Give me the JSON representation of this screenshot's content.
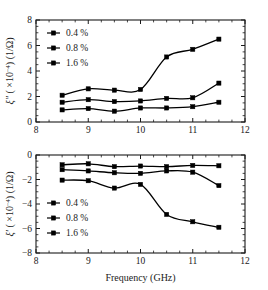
{
  "figure": {
    "background": "#ffffff",
    "line_color": "#000000",
    "text_color": "#1a1a1a"
  },
  "axis": {
    "xlabel": "Frequency (GHz)",
    "xticks": [
      "8",
      "9",
      "10",
      "11",
      "12"
    ],
    "top_ylabel_parts": {
      "symbol": "ξ″",
      "scale_open": " ( ×10",
      "exponent": "-4",
      "scale_close": ") (1/Ω)"
    },
    "bottom_ylabel_parts": {
      "symbol": "ξ′",
      "scale_open": " ( ×10",
      "exponent": "-4",
      "scale_close": ") (1/Ω)"
    },
    "top_yticks": [
      "0",
      "2",
      "4",
      "6",
      "8"
    ],
    "bottom_yticks": [
      "-8",
      "-6",
      "-4",
      "-2",
      "0"
    ]
  },
  "legend": {
    "entries": [
      "0.4 %",
      "0.8 %",
      "1.6 %"
    ],
    "marker": "square-marker"
  },
  "chart_data": [
    {
      "type": "line",
      "title": "",
      "panel": "top",
      "xlabel": "Frequency (GHz)",
      "ylabel": "ξ″ ( ×10⁻⁴) (1/Ω)",
      "xlim": [
        8,
        12
      ],
      "ylim": [
        0,
        8
      ],
      "xticks": [
        8,
        9,
        10,
        11,
        12
      ],
      "yticks": [
        0,
        2,
        4,
        6,
        8
      ],
      "grid": false,
      "legend_position": "upper-left",
      "x": [
        8.5,
        9.0,
        9.5,
        10.0,
        10.5,
        11.0,
        11.5
      ],
      "series": [
        {
          "name": "0.4 %",
          "values": [
            0.95,
            1.05,
            0.85,
            1.1,
            1.1,
            1.2,
            1.55
          ]
        },
        {
          "name": "0.8 %",
          "values": [
            1.55,
            1.75,
            1.6,
            1.65,
            1.85,
            1.9,
            3.05
          ]
        },
        {
          "name": "1.6 %",
          "values": [
            2.1,
            2.6,
            2.5,
            2.55,
            5.1,
            5.7,
            6.5
          ]
        }
      ]
    },
    {
      "type": "line",
      "title": "",
      "panel": "bottom",
      "xlabel": "Frequency (GHz)",
      "ylabel": "ξ′ ( ×10⁻⁴) (1/Ω)",
      "xlim": [
        8,
        12
      ],
      "ylim": [
        -8,
        0
      ],
      "xticks": [
        8,
        9,
        10,
        11,
        12
      ],
      "yticks": [
        -8,
        -6,
        -4,
        -2,
        0
      ],
      "grid": false,
      "legend_position": "lower-left",
      "x": [
        8.5,
        9.0,
        9.5,
        10.0,
        10.5,
        11.0,
        11.5
      ],
      "series": [
        {
          "name": "0.4 %",
          "values": [
            -0.8,
            -0.72,
            -0.95,
            -0.9,
            -0.95,
            -0.85,
            -0.88
          ]
        },
        {
          "name": "0.8 %",
          "values": [
            -1.2,
            -1.3,
            -1.45,
            -1.5,
            -1.3,
            -1.4,
            -2.5
          ]
        },
        {
          "name": "1.6 %",
          "values": [
            -2.05,
            -2.1,
            -2.7,
            -2.4,
            -4.85,
            -5.45,
            -5.9
          ]
        }
      ]
    }
  ]
}
